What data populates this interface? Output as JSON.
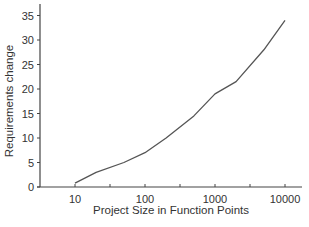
{
  "chart_data": {
    "type": "line",
    "title": "",
    "xlabel": "Project Size in Function Points",
    "ylabel": "Requirements change",
    "xscale": "log",
    "xlim": [
      3.2,
      31623
    ],
    "ylim": [
      0,
      37
    ],
    "x_ticks": [
      10,
      100,
      1000,
      10000
    ],
    "x_tick_labels": [
      "10",
      "100",
      "1000",
      "10000"
    ],
    "y_ticks": [
      0,
      5,
      10,
      15,
      20,
      25,
      30,
      35
    ],
    "y_tick_labels": [
      "0",
      "5",
      "10",
      "15",
      "20",
      "25",
      "30",
      "35"
    ],
    "grid": false,
    "legend": null,
    "series": [
      {
        "name": "Requirements change",
        "color": "#555555",
        "x": [
          10,
          20,
          50,
          100,
          200,
          500,
          1000,
          2000,
          5000,
          10000
        ],
        "y": [
          0.8,
          3,
          5,
          7,
          10,
          14.5,
          19,
          21.5,
          28,
          34
        ]
      }
    ]
  }
}
